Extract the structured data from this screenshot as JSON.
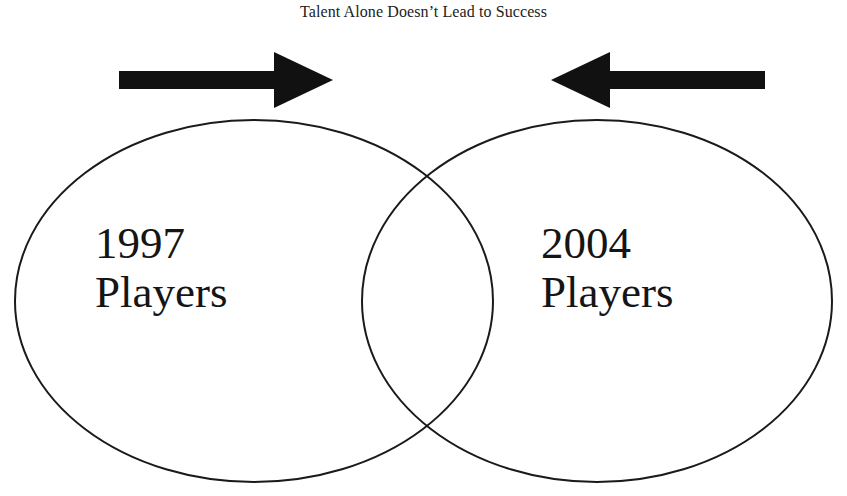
{
  "title": "Talent Alone Doesn’t Lead to Success",
  "diagram": {
    "type": "venn",
    "sets": [
      {
        "id": "left",
        "year": "1997",
        "noun": "Players"
      },
      {
        "id": "right",
        "year": "2004",
        "noun": "Players"
      }
    ],
    "overlap_label": "",
    "arrows": [
      {
        "direction": "right",
        "icon": "arrow-right-icon"
      },
      {
        "direction": "left",
        "icon": "arrow-left-icon"
      }
    ],
    "colors": {
      "stroke": "#1a1a1a",
      "arrow_fill": "#111111",
      "background": "#ffffff"
    }
  }
}
